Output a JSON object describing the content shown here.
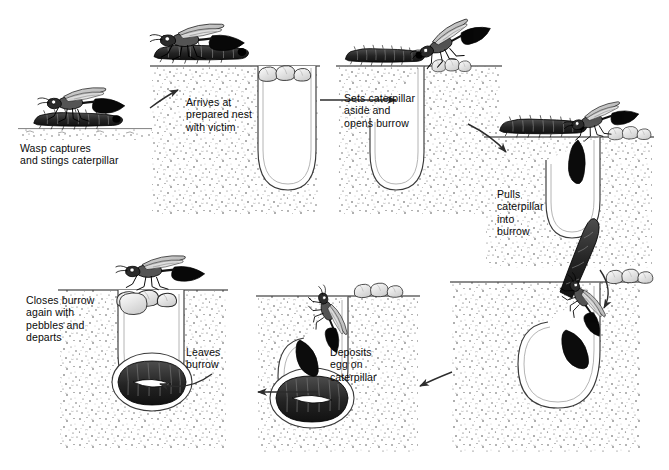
{
  "diagram": {
    "kind": "life-cycle-diagram",
    "style": "black-and-white pen-and-ink stipple scientific illustration",
    "background_color": "#ffffff",
    "ink_color": "#1a1a1a",
    "soil_tone": "#7a7a7a",
    "flow_direction": "clockwise",
    "stages": [
      {
        "id": "capture",
        "label": "Wasp captures\nand stings caterpillar",
        "label_x": 20,
        "label_y": 142,
        "scene_x": 28,
        "scene_y": 80,
        "scene_w": 120,
        "scene_h": 56,
        "scene_type": "surface-only",
        "has_burrow": false,
        "wasp": true,
        "caterpillar": "surface",
        "pebbles": 0
      },
      {
        "id": "arrives",
        "label": "Arrives at\nprepared nest\nwith victim",
        "label_x": 186,
        "label_y": 96,
        "scene_x": 140,
        "scene_y": 22,
        "scene_w": 175,
        "scene_h": 195,
        "scene_type": "burrow-closed",
        "has_burrow": true,
        "wasp": true,
        "caterpillar": "carried",
        "pebbles": 4
      },
      {
        "id": "sets-aside",
        "label": "Sets caterpillar\naside and\nopens burrow",
        "label_x": 344,
        "label_y": 92,
        "scene_x": 330,
        "scene_y": 22,
        "scene_w": 175,
        "scene_h": 195,
        "scene_type": "burrow-open",
        "has_burrow": true,
        "wasp": true,
        "caterpillar": "aside",
        "pebbles": 2
      },
      {
        "id": "pulls-in",
        "label": "Pulls\ncaterpillar\ninto\nburrow",
        "label_x": 497,
        "label_y": 188,
        "scene_x": 480,
        "scene_y": 110,
        "scene_w": 180,
        "scene_h": 160,
        "scene_type": "burrow-open",
        "has_burrow": true,
        "wasp": true,
        "caterpillar": "entering",
        "pebbles": 3
      },
      {
        "id": "deposits-egg",
        "label": "Deposits\negg on\ncaterpillar",
        "label_x": 330,
        "label_y": 346,
        "scene_x": 440,
        "scene_y": 250,
        "scene_w": 180,
        "scene_h": 200,
        "scene_type": "burrow-open-deep",
        "has_burrow": true,
        "wasp": true,
        "caterpillar": "in-chamber",
        "pebbles": 3
      },
      {
        "id": "leaves",
        "label": "Leaves\nburrow",
        "label_x": 186,
        "label_y": 346,
        "scene_x": 247,
        "scene_y": 265,
        "scene_w": 165,
        "scene_h": 185,
        "scene_type": "burrow-open-deep",
        "has_burrow": true,
        "wasp": true,
        "caterpillar": "in-chamber-with-egg",
        "pebbles": 4
      },
      {
        "id": "closes",
        "label": "Closes burrow\nagain with\npebbles and\ndeparts",
        "label_x": 26,
        "label_y": 294,
        "scene_x": 55,
        "scene_y": 255,
        "scene_w": 165,
        "scene_h": 190,
        "scene_type": "burrow-closed-deep",
        "has_burrow": true,
        "wasp": true,
        "caterpillar": "in-chamber-with-egg",
        "pebbles": 3
      }
    ],
    "arrows": [
      {
        "id": "arrow-capture-to-arrives",
        "from": "capture",
        "to": "arrives",
        "direction": "right-up"
      },
      {
        "id": "arrow-arrives-to-setsaside",
        "from": "arrives",
        "to": "sets-aside",
        "direction": "right"
      },
      {
        "id": "arrow-setsaside-to-pullsin",
        "from": "sets-aside",
        "to": "pulls-in",
        "direction": "right-down"
      },
      {
        "id": "arrow-pullsin-to-deposits",
        "from": "pulls-in",
        "to": "deposits-egg",
        "direction": "down"
      },
      {
        "id": "arrow-deposits-to-leaves",
        "from": "deposits-egg",
        "to": "leaves",
        "direction": "left"
      },
      {
        "id": "arrow-leaves-to-closes",
        "from": "leaves",
        "to": "closes",
        "direction": "left"
      },
      {
        "id": "arrow-deposits-inner",
        "from": "deposits-egg",
        "to": "leaves",
        "direction": "left-inner"
      }
    ]
  }
}
